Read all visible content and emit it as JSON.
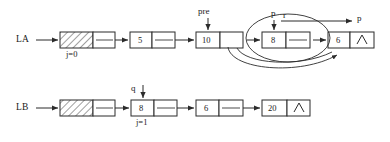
{
  "figure": {
    "type": "linked-list-merge-diagram",
    "background": "#ffffff",
    "stroke": "#2b2b2b",
    "hatch_fill": "#ffffff"
  },
  "lists": [
    {
      "id": "LA",
      "label": "LA",
      "index_label": "j=0",
      "nodes": [
        {
          "name": "head-node",
          "data": "",
          "hatched": true,
          "next": "link",
          "data_w": 33,
          "ptr_w": 22
        },
        {
          "name": "node-5",
          "data": "5",
          "hatched": false,
          "next": "link",
          "data_w": 22,
          "ptr_w": 23
        },
        {
          "name": "node-10",
          "data": "10",
          "hatched": false,
          "next": "link",
          "data_w": 24,
          "ptr_w": 23
        },
        {
          "name": "node-8",
          "data": "8",
          "hatched": false,
          "next": "link",
          "data_w": 24,
          "ptr_w": 24
        },
        {
          "name": "node-6",
          "data": "6",
          "hatched": false,
          "next": "null",
          "data_w": 22,
          "ptr_w": 24
        }
      ]
    },
    {
      "id": "LB",
      "label": "LB",
      "index_label": "j=1",
      "nodes": [
        {
          "name": "head-node",
          "data": "",
          "hatched": true,
          "next": "link",
          "data_w": 33,
          "ptr_w": 22
        },
        {
          "name": "node-8",
          "data": "8",
          "hatched": false,
          "next": "link",
          "data_w": 23,
          "ptr_w": 23
        },
        {
          "name": "node-6",
          "data": "6",
          "hatched": false,
          "next": "link",
          "data_w": 23,
          "ptr_w": 24
        },
        {
          "name": "node-20",
          "data": "20",
          "hatched": false,
          "next": "null",
          "data_w": 25,
          "ptr_w": 23
        }
      ]
    }
  ],
  "pointers": [
    {
      "name": "pre-pointer",
      "label": "pre",
      "direction": "down"
    },
    {
      "name": "p-pointer-inner",
      "label": "p",
      "direction": "down"
    },
    {
      "name": "r-pointer",
      "label": "r",
      "direction": "right"
    },
    {
      "name": "p-pointer-target",
      "label": "p",
      "direction": "right-target"
    },
    {
      "name": "q-pointer",
      "label": "q",
      "direction": "down"
    }
  ],
  "null_symbol": "∧",
  "annotations": {
    "highlight_ellipse": "selected-node-group",
    "curve_1": "relink-curve-from-10-to-6",
    "curve_2": "relink-curve-from-8-to-6"
  }
}
